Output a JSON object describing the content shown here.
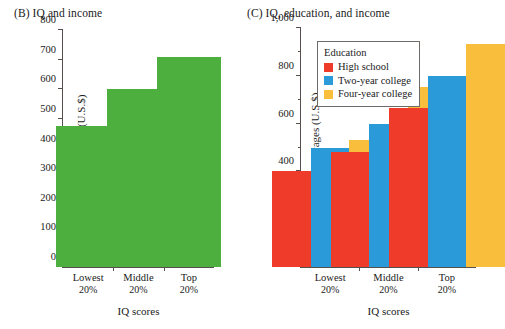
{
  "chart_data": [
    {
      "type": "bar",
      "panel": "(B)",
      "title": "(B)  IQ and income",
      "title_text": "IQ and income",
      "categories": [
        "Lowest",
        "Middle",
        "Top"
      ],
      "category_sublabels": [
        "20%",
        "20%",
        "20%"
      ],
      "values": [
        475,
        600,
        710
      ],
      "series": [
        {
          "name": "Weekly wages",
          "values": [
            475,
            600,
            710
          ],
          "color": "#4CAF3E"
        }
      ],
      "xlabel": "IQ scores",
      "ylabel": "Weekly wages (U.S.$)",
      "ylim": [
        0,
        800
      ],
      "ytick_values": [
        0,
        100,
        200,
        300,
        400,
        500,
        600,
        700,
        800
      ],
      "ytick_labels": [
        "0",
        "100",
        "200",
        "300",
        "400",
        "500",
        "600",
        "700",
        "800"
      ],
      "minor_ticks": false,
      "grid": false,
      "legend": null
    },
    {
      "type": "bar",
      "panel": "(C)",
      "title": "(C)  IQ, education, and income",
      "title_text": "IQ, education, and income",
      "categories": [
        "Lowest",
        "Middle",
        "Top"
      ],
      "category_sublabels": [
        "20%",
        "20%",
        "20%"
      ],
      "series": [
        {
          "name": "High school",
          "values": [
            400,
            480,
            665
          ],
          "color": "#EE3B2A"
        },
        {
          "name": "Two-year college",
          "values": [
            500,
            600,
            800
          ],
          "color": "#2B9AD9"
        },
        {
          "name": "Four-year college",
          "values": [
            530,
            755,
            935
          ],
          "color": "#F9BE3C"
        }
      ],
      "xlabel": "IQ scores",
      "ylabel": "Weekly wages (U.S.$)",
      "ylim": [
        0,
        1000
      ],
      "ytick_values": [
        0,
        200,
        400,
        600,
        800,
        1000
      ],
      "ytick_labels": [
        "0",
        "200",
        "400",
        "600",
        "800",
        "1,000"
      ],
      "minor_tick_values": [
        100,
        300,
        500,
        700,
        900
      ],
      "minor_ticks": true,
      "grid": false,
      "legend": {
        "title": "Education",
        "position": "upper-left-inside",
        "entries": [
          {
            "label": "High school",
            "color": "#EE3B2A"
          },
          {
            "label": "Two-year college",
            "color": "#2B9AD9"
          },
          {
            "label": "Four-year college",
            "color": "#F9BE3C"
          }
        ]
      }
    }
  ]
}
